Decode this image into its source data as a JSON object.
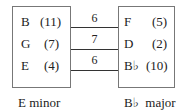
{
  "left_key": {
    "caption": "E minor",
    "notes": [
      {
        "name": "B",
        "value": "(11)"
      },
      {
        "name": "G",
        "value": "(7)"
      },
      {
        "name": "E",
        "value": "(4)"
      }
    ]
  },
  "right_key": {
    "caption": "B♭  major",
    "notes": [
      {
        "name": "F",
        "value": "(5)"
      },
      {
        "name": "D",
        "value": "(2)"
      },
      {
        "name": "B♭",
        "value": "(10)"
      }
    ]
  },
  "connections": [
    {
      "from": "B",
      "to": "F",
      "label": "6"
    },
    {
      "from": "G",
      "to": "D",
      "label": "7"
    },
    {
      "from": "E",
      "to": "B♭",
      "label": "6"
    }
  ]
}
